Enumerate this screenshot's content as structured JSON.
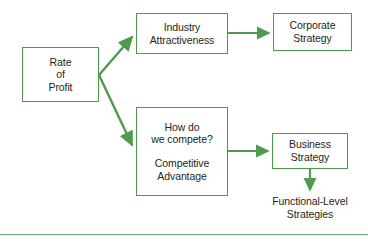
{
  "diagram": {
    "type": "flowchart",
    "accent_color": "#4f9a4f",
    "text_color": "#231f20",
    "background_color": "#ffffff",
    "nodes": [
      {
        "id": "rate-of-profit",
        "lines": [
          "Rate",
          "of",
          "Profit"
        ],
        "boxed": true
      },
      {
        "id": "industry-attractiveness",
        "lines": [
          "Industry",
          "Attractiveness"
        ],
        "boxed": true
      },
      {
        "id": "corporate-strategy",
        "lines": [
          "Corporate",
          "Strategy"
        ],
        "boxed": true
      },
      {
        "id": "how-do-we-compete",
        "lines": [
          "How do",
          "we compete?",
          "Competitive",
          "Advantage"
        ],
        "boxed": true
      },
      {
        "id": "business-strategy",
        "lines": [
          "Business",
          "Strategy"
        ],
        "boxed": true
      },
      {
        "id": "functional-level-strategies",
        "lines": [
          "Functional-Level",
          "Strategies"
        ],
        "boxed": false
      }
    ],
    "edges": [
      {
        "from": "rate-of-profit",
        "to": "industry-attractiveness",
        "style": "diagonal-up"
      },
      {
        "from": "rate-of-profit",
        "to": "how-do-we-compete",
        "style": "diagonal-down"
      },
      {
        "from": "industry-attractiveness",
        "to": "corporate-strategy",
        "style": "horizontal"
      },
      {
        "from": "how-do-we-compete",
        "to": "business-strategy",
        "style": "horizontal"
      },
      {
        "from": "business-strategy",
        "to": "functional-level-strategies",
        "style": "vertical-down"
      }
    ],
    "rule": {
      "id": "baseline-rule",
      "color": "#6aa86a"
    }
  }
}
